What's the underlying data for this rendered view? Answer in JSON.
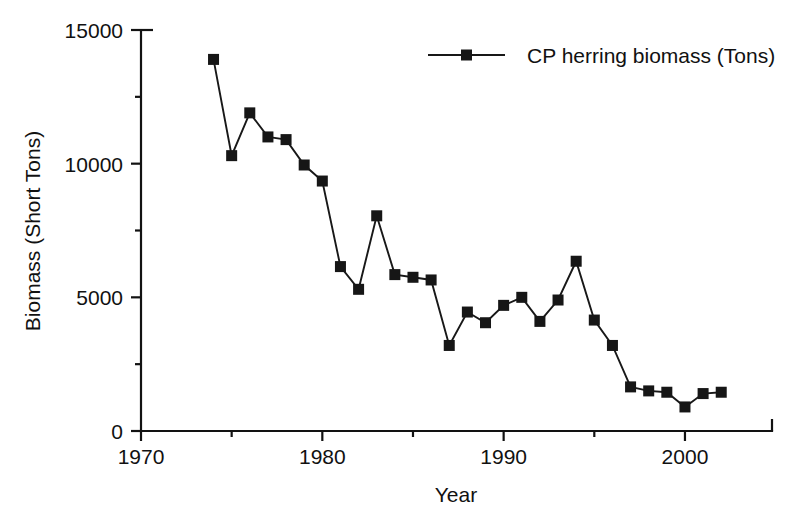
{
  "chart_data": {
    "type": "line",
    "title": "",
    "xlabel": "Year",
    "ylabel": "Biomass (Short Tons)",
    "xlim": [
      1970,
      2004.8
    ],
    "ylim": [
      0,
      15000
    ],
    "grid": false,
    "legend_position": "top-right",
    "x_ticks_major": [
      1970,
      1980,
      1990,
      2000
    ],
    "x_tick_labels": [
      "1970",
      "1980",
      "1990",
      "2000"
    ],
    "x_ticks_minor": [
      1975,
      1985,
      1995
    ],
    "y_ticks_major": [
      0,
      5000,
      10000,
      15000
    ],
    "y_tick_labels": [
      "0",
      "5000",
      "10000",
      "15000"
    ],
    "y_ticks_minor": [
      2500,
      7500,
      12500
    ],
    "series": [
      {
        "name": "CP herring biomass (Tons)",
        "marker": "square",
        "color": "#161616",
        "x": [
          1974,
          1975,
          1976,
          1977,
          1978,
          1979,
          1980,
          1981,
          1982,
          1983,
          1984,
          1985,
          1986,
          1987,
          1988,
          1989,
          1990,
          1991,
          1992,
          1993,
          1994,
          1995,
          1996,
          1997,
          1998,
          1999,
          2000,
          2001,
          2002
        ],
        "values": [
          13900,
          10300,
          11900,
          11000,
          10900,
          9950,
          9350,
          6150,
          5300,
          8050,
          5850,
          5750,
          5650,
          3200,
          4450,
          4050,
          4700,
          5000,
          4100,
          4900,
          6350,
          4150,
          3200,
          1650,
          1500,
          1450,
          900,
          1400,
          1450
        ]
      }
    ]
  },
  "legend": {
    "entries": [
      {
        "label": "CP herring biomass (Tons)",
        "marker": "square",
        "color": "#161616"
      }
    ]
  },
  "axes": {
    "x_axis_title": "Year",
    "y_axis_title": "Biomass (Short Tons)"
  },
  "colors": {
    "ink": "#161616",
    "background": "#ffffff"
  }
}
